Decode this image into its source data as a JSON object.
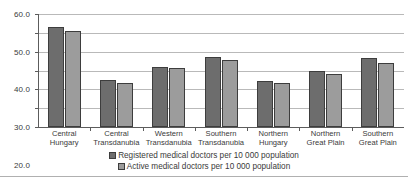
{
  "chart_data": {
    "type": "bar",
    "title": "",
    "subtitle": "",
    "xlabel": "",
    "ylabel": "",
    "ylim": [
      0,
      60
    ],
    "ytick_step": 10,
    "yticks": [
      "0.0",
      "10.0",
      "20.0",
      "30.0",
      "40.0",
      "50.0",
      "60.0"
    ],
    "grid": true,
    "legend_position": "bottom",
    "categories": [
      "Central Hungary",
      "Central Transdanubia",
      "Western Transdanubia",
      "Southern Transdanubia",
      "Northern Hungary",
      "Northern Great Plain",
      "Southern Great Plain"
    ],
    "category_lines": [
      [
        "Central",
        "Hungary"
      ],
      [
        "Central",
        "Transdanubia"
      ],
      [
        "Western",
        "Transdanubia"
      ],
      [
        "Southern",
        "Transdanubia"
      ],
      [
        "Northern",
        "Hungary"
      ],
      [
        "Northern",
        "Great Plain"
      ],
      [
        "Southern",
        "Great Plain"
      ]
    ],
    "series": [
      {
        "name": "Registered medical doctors per 10 000 population",
        "color": "#6d6d6d",
        "values": [
          53.0,
          24.8,
          32.0,
          37.0,
          24.5,
          29.8,
          36.4
        ]
      },
      {
        "name": "Active medical doctors per 10 000 population",
        "color": "#9c9c9c",
        "values": [
          51.0,
          23.3,
          31.2,
          35.7,
          23.6,
          28.2,
          33.9
        ]
      }
    ]
  },
  "axis": {
    "line_color": "#5c5c5c",
    "grid_color": "#b9b9b9"
  }
}
